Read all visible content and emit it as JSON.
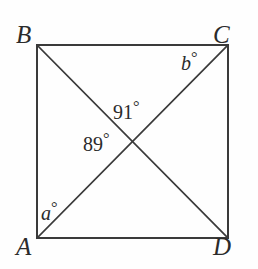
{
  "figure": {
    "name": "square-with-diagonals",
    "shape": "square",
    "stroke_color": "#3a3a3a",
    "background_color": "#fefefe",
    "text_color": "#2b2b2b",
    "vertices": [
      {
        "id": "B",
        "label": "B",
        "position": "top-left",
        "x": 37,
        "y": 45
      },
      {
        "id": "C",
        "label": "C",
        "position": "top-right",
        "x": 228,
        "y": 45
      },
      {
        "id": "A",
        "label": "A",
        "position": "bottom-left",
        "x": 37,
        "y": 238
      },
      {
        "id": "D",
        "label": "D",
        "position": "bottom-right",
        "x": 228,
        "y": 238
      }
    ],
    "edges": [
      {
        "id": "BC",
        "from": "B",
        "to": "C",
        "type": "side"
      },
      {
        "id": "CD",
        "from": "C",
        "to": "D",
        "type": "side"
      },
      {
        "id": "DA",
        "from": "D",
        "to": "A",
        "type": "side"
      },
      {
        "id": "AB",
        "from": "A",
        "to": "B",
        "type": "side"
      },
      {
        "id": "BD",
        "from": "B",
        "to": "D",
        "type": "diagonal"
      },
      {
        "id": "AC",
        "from": "A",
        "to": "C",
        "type": "diagonal"
      }
    ],
    "intersection": {
      "x": 133,
      "y": 142
    },
    "angles": [
      {
        "id": "angle-91",
        "value": "91",
        "unit": "°",
        "kind": "numeric",
        "at": "intersection-top",
        "x": 113,
        "y": 99
      },
      {
        "id": "angle-89",
        "value": "89",
        "unit": "°",
        "kind": "numeric",
        "at": "intersection-left",
        "x": 83,
        "y": 131
      },
      {
        "id": "angle-b",
        "value": "b",
        "unit": "°",
        "kind": "variable",
        "at": "vertex-C-interior",
        "x": 181,
        "y": 50
      },
      {
        "id": "angle-a",
        "value": "a",
        "unit": "°",
        "kind": "variable",
        "at": "vertex-A-interior",
        "x": 41,
        "y": 200
      }
    ]
  }
}
